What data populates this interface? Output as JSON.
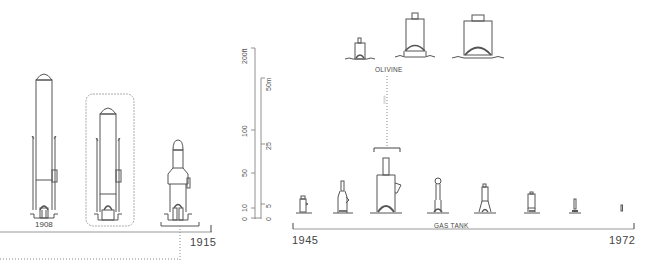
{
  "diagram": {
    "type": "evolution-timeline",
    "colors": {
      "line": "#555555",
      "dotted": "#888888",
      "background": "#ffffff",
      "frame": "#aaaaaa"
    },
    "left_panel": {
      "figures": [
        {
          "id": "fig-1908",
          "label": "1908",
          "style": "tall-domed-tower"
        },
        {
          "id": "fig-framed",
          "label": "",
          "style": "tall-domed-tower-framed"
        },
        {
          "id": "fig-1915",
          "label": "",
          "style": "stepped-tower"
        }
      ],
      "timeline_end_label": "1915"
    },
    "scale_bar": {
      "imperial_ticks": [
        "0",
        "10",
        "50",
        "100",
        "200ft"
      ],
      "metric_ticks": [
        "0",
        "5",
        "25",
        "50m"
      ]
    },
    "top_group": {
      "label": "OLIVINE",
      "figures": [
        {
          "id": "olivine-small",
          "style": "small-box"
        },
        {
          "id": "olivine-medium",
          "style": "medium-box"
        },
        {
          "id": "olivine-large",
          "style": "large-box"
        }
      ]
    },
    "right_timeline": {
      "start_label": "1945",
      "end_label": "1972",
      "mid_label": "GAS TANK",
      "figures": [
        {
          "id": "t1",
          "style": "small"
        },
        {
          "id": "t2",
          "style": "bottle"
        },
        {
          "id": "t3",
          "style": "large-stack"
        },
        {
          "id": "t4",
          "style": "bulb"
        },
        {
          "id": "t5",
          "style": "tapered"
        },
        {
          "id": "t6",
          "style": "box"
        },
        {
          "id": "t7",
          "style": "tiny"
        },
        {
          "id": "t8",
          "style": "micro"
        }
      ]
    }
  }
}
